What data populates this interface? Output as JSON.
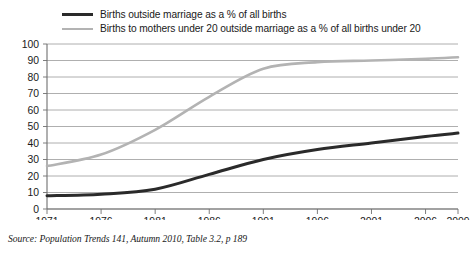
{
  "chart_data": {
    "type": "line",
    "title": "",
    "subtitle": "",
    "xlabel": "",
    "ylabel": "",
    "x": [
      1971,
      1976,
      1981,
      1986,
      1991,
      1996,
      2001,
      2006,
      2009
    ],
    "xlim": [
      1971,
      2009
    ],
    "ylim": [
      0,
      100
    ],
    "y_ticks": [
      0,
      10,
      20,
      30,
      40,
      50,
      60,
      70,
      80,
      90,
      100
    ],
    "x_ticks": [
      "1971",
      "1976",
      "1981",
      "1986",
      "1991",
      "1996",
      "2001",
      "2006",
      "2009"
    ],
    "grid": "horizontal",
    "legend_position": "top",
    "series": [
      {
        "name": "Births outside marriage as a % of all births",
        "color": "#2a2a2a",
        "width": 3,
        "values": [
          8,
          9,
          12,
          21,
          30,
          36,
          40,
          44,
          46
        ]
      },
      {
        "name": "Births to mothers under 20 outside marriage as a % of all births under 20",
        "color": "#b3b3b3",
        "width": 2.6,
        "values": [
          26,
          33,
          48,
          68,
          85,
          89,
          90,
          91,
          92
        ]
      }
    ],
    "annotations": []
  },
  "legend": {
    "items": [
      {
        "label": "Births outside marriage as a % of all births",
        "swatch": "thick-dark-line-swatch"
      },
      {
        "label": "Births to mothers under 20 outside marriage as a % of all births under 20",
        "swatch": "thin-grey-line-swatch"
      }
    ]
  },
  "source": {
    "text": "Source: Population Trends 141, Autumn 2010, Table 3.2, p 189"
  },
  "colors": {
    "series_dark": "#2a2a2a",
    "series_light": "#b3b3b3",
    "gridline": "#9a9a9a",
    "axis": "#6f6f6f",
    "text": "#1a1a1a",
    "background": "#ffffff"
  }
}
